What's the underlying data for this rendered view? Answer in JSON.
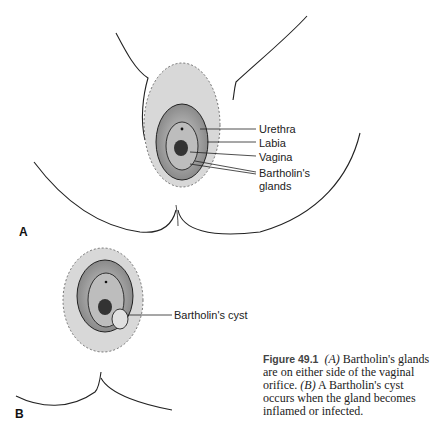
{
  "figure": {
    "panel_a_letter": "A",
    "panel_b_letter": "B",
    "panel_a_labels": {
      "urethra": "Urethra",
      "labia": "Labia",
      "vagina": "Vagina",
      "bartholins_line1": "Bartholin's",
      "bartholins_line2": "glands"
    },
    "panel_b_labels": {
      "cyst": "Bartholin's cyst"
    },
    "caption": {
      "number": "Figure 49.1",
      "part_a_marker": "(A)",
      "part_a_text": " Bartholin's glands are on either side of the vaginal orifice. ",
      "part_b_marker": "(B)",
      "part_b_text": " A Bartholin's cyst occurs when the gland becomes inflamed or infected."
    }
  },
  "colors": {
    "line": "#222222",
    "shade": "#9a9a9a",
    "dark": "#333333",
    "background": "#ffffff"
  }
}
